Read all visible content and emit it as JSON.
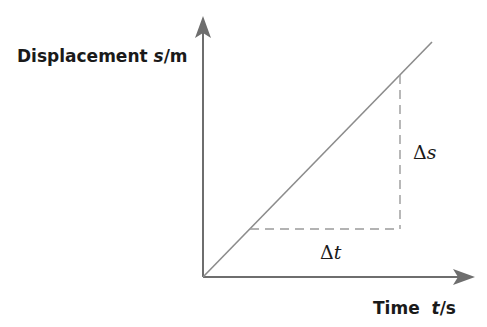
{
  "diagram": {
    "type": "displacement-time graph",
    "y_axis": {
      "label_prefix": "Displacement ",
      "label_var": "s",
      "label_unit": "/m"
    },
    "x_axis": {
      "label_prefix": "Time  ",
      "label_var": "t",
      "label_unit": "/s"
    },
    "gradient_triangle": {
      "vertical_label_delta": "Δ",
      "vertical_label_var": "s",
      "horizontal_label_delta": "Δ",
      "horizontal_label_var": "t"
    },
    "colors": {
      "axis": "#6e6e6e",
      "line": "#8c8c8c",
      "dashed": "#9a9a9a",
      "text": "#1a1a1a"
    }
  }
}
